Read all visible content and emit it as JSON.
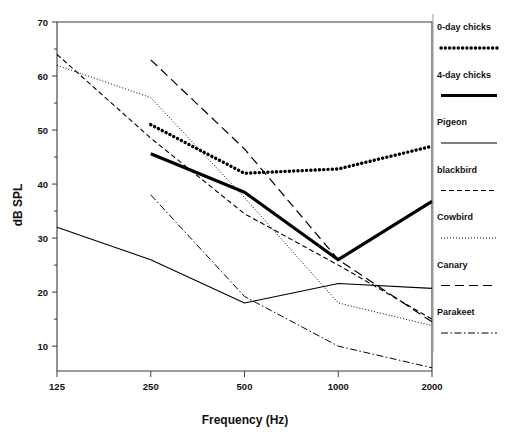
{
  "chart_data": {
    "type": "line",
    "title": "",
    "xlabel": "Frequency (Hz)",
    "ylabel": "dB SPL",
    "x": [
      125,
      250,
      500,
      1000,
      2000
    ],
    "xtick_labels": [
      "125",
      "250",
      "500",
      "1000",
      "2000"
    ],
    "x_scale": "log-categorical",
    "ytick_labels": [
      "10",
      "20",
      "30",
      "40",
      "50",
      "60",
      "70"
    ],
    "yticks": [
      10,
      20,
      30,
      40,
      50,
      60,
      70
    ],
    "ylim": [
      5.4,
      70
    ],
    "grid": false,
    "legend_position": "right-outside",
    "series": [
      {
        "name": "0-day chicks",
        "style": "thick-dotted",
        "x": [
          250,
          500,
          1000,
          2000
        ],
        "values": [
          51.0,
          42.0,
          42.8,
          47.0
        ]
      },
      {
        "name": "4-day chicks",
        "style": "thick-solid",
        "x": [
          250,
          500,
          1000,
          2000
        ],
        "values": [
          45.6,
          38.5,
          26.0,
          36.8
        ]
      },
      {
        "name": "Pigeon",
        "style": "thin-solid",
        "x": [
          125,
          250,
          500,
          1000,
          2000
        ],
        "values": [
          32.0,
          26.0,
          18.0,
          21.6,
          20.7
        ]
      },
      {
        "name": "blackbird",
        "style": "dashed",
        "x": [
          125,
          250,
          500,
          1000,
          2000
        ],
        "values": [
          64.0,
          48.5,
          34.5,
          25.0,
          15.0
        ]
      },
      {
        "name": "Cowbird",
        "style": "fine-dotted",
        "x": [
          125,
          250,
          500,
          1000,
          2000
        ],
        "values": [
          62.0,
          56.0,
          37.5,
          18.0,
          13.8
        ]
      },
      {
        "name": "Canary",
        "style": "long-dash",
        "x": [
          250,
          500,
          1000,
          2000
        ],
        "values": [
          63.0,
          46.5,
          26.0,
          14.5
        ]
      },
      {
        "name": "Parakeet",
        "style": "dash-dot",
        "x": [
          250,
          500,
          1000,
          2000
        ],
        "values": [
          38.0,
          19.2,
          10.0,
          6.0
        ]
      }
    ]
  },
  "legend": {
    "items": [
      {
        "label": "0-day chicks",
        "style": "thick-dotted"
      },
      {
        "label": "4-day chicks",
        "style": "thick-solid"
      },
      {
        "label": "Pigeon",
        "style": "thin-solid"
      },
      {
        "label": "blackbird",
        "style": "dashed"
      },
      {
        "label": "Cowbird",
        "style": "fine-dotted"
      },
      {
        "label": "Canary",
        "style": "long-dash"
      },
      {
        "label": "Parakeet",
        "style": "dash-dot"
      }
    ]
  },
  "axes": {
    "x_title": "Frequency (Hz)",
    "y_title": "dB SPL",
    "x_ticks": [
      "125",
      "250",
      "500",
      "1000",
      "2000"
    ],
    "y_ticks": [
      "10",
      "20",
      "30",
      "40",
      "50",
      "60",
      "70"
    ]
  }
}
